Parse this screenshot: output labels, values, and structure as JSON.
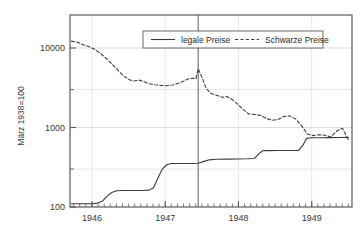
{
  "chart_data": {
    "type": "line",
    "title": "",
    "xlabel": "",
    "ylabel": "März 1938=100",
    "y_scale": "log",
    "ylim": [
      100,
      20000
    ],
    "xlim": [
      1945.7,
      1949.55
    ],
    "grid": true,
    "legend_position": "top-center",
    "y_ticks": [
      {
        "value": 100,
        "label": "100"
      },
      {
        "value": 1000,
        "label": "1000"
      },
      {
        "value": 10000,
        "label": "10000"
      }
    ],
    "y_minor_gridlines": [
      300,
      3000
    ],
    "x_ticks": [
      {
        "value": 1946,
        "label": "1946"
      },
      {
        "value": 1947,
        "label": "1947"
      },
      {
        "value": 1948,
        "label": "1948"
      },
      {
        "value": 1949,
        "label": "1949"
      }
    ],
    "annotations": [
      {
        "type": "vline",
        "x": 1947.45,
        "label": ""
      }
    ],
    "series": [
      {
        "name": "legale Preise",
        "style": "solid",
        "color": "#3c3c3c",
        "points": [
          [
            1945.72,
            110
          ],
          [
            1945.8,
            110
          ],
          [
            1945.9,
            110
          ],
          [
            1946.0,
            110
          ],
          [
            1946.08,
            112
          ],
          [
            1946.14,
            118
          ],
          [
            1946.2,
            135
          ],
          [
            1946.27,
            152
          ],
          [
            1946.34,
            160
          ],
          [
            1946.42,
            161
          ],
          [
            1946.5,
            161
          ],
          [
            1946.6,
            161
          ],
          [
            1946.7,
            161
          ],
          [
            1946.78,
            163
          ],
          [
            1946.84,
            175
          ],
          [
            1946.9,
            230
          ],
          [
            1946.96,
            300
          ],
          [
            1947.02,
            340
          ],
          [
            1947.08,
            352
          ],
          [
            1947.16,
            353
          ],
          [
            1947.28,
            353
          ],
          [
            1947.4,
            353
          ],
          [
            1947.45,
            355
          ],
          [
            1947.52,
            372
          ],
          [
            1947.6,
            392
          ],
          [
            1947.7,
            398
          ],
          [
            1947.85,
            400
          ],
          [
            1948.0,
            402
          ],
          [
            1948.12,
            404
          ],
          [
            1948.22,
            408
          ],
          [
            1948.28,
            470
          ],
          [
            1948.33,
            510
          ],
          [
            1948.4,
            512
          ],
          [
            1948.55,
            513
          ],
          [
            1948.7,
            514
          ],
          [
            1948.82,
            515
          ],
          [
            1948.88,
            600
          ],
          [
            1948.93,
            730
          ],
          [
            1949.0,
            742
          ],
          [
            1949.12,
            744
          ],
          [
            1949.25,
            745
          ],
          [
            1949.38,
            748
          ],
          [
            1949.5,
            752
          ]
        ]
      },
      {
        "name": "Schwarze Preise",
        "style": "dashed",
        "color": "#3c3c3c",
        "points": [
          [
            1945.72,
            12200
          ],
          [
            1945.8,
            11800
          ],
          [
            1945.88,
            11000
          ],
          [
            1945.96,
            10400
          ],
          [
            1946.04,
            9600
          ],
          [
            1946.12,
            8500
          ],
          [
            1946.2,
            7300
          ],
          [
            1946.28,
            6200
          ],
          [
            1946.36,
            5200
          ],
          [
            1946.44,
            4400
          ],
          [
            1946.52,
            3950
          ],
          [
            1946.58,
            3850
          ],
          [
            1946.64,
            3950
          ],
          [
            1946.7,
            3800
          ],
          [
            1946.78,
            3550
          ],
          [
            1946.86,
            3450
          ],
          [
            1946.94,
            3380
          ],
          [
            1947.02,
            3350
          ],
          [
            1947.1,
            3420
          ],
          [
            1947.18,
            3600
          ],
          [
            1947.26,
            3850
          ],
          [
            1947.32,
            4100
          ],
          [
            1947.38,
            4150
          ],
          [
            1947.42,
            4100
          ],
          [
            1947.45,
            5500
          ],
          [
            1947.5,
            4300
          ],
          [
            1947.56,
            3100
          ],
          [
            1947.62,
            2700
          ],
          [
            1947.7,
            2550
          ],
          [
            1947.78,
            2400
          ],
          [
            1947.84,
            2450
          ],
          [
            1947.9,
            2300
          ],
          [
            1947.98,
            2000
          ],
          [
            1948.06,
            1700
          ],
          [
            1948.14,
            1480
          ],
          [
            1948.22,
            1460
          ],
          [
            1948.3,
            1420
          ],
          [
            1948.38,
            1300
          ],
          [
            1948.46,
            1230
          ],
          [
            1948.54,
            1260
          ],
          [
            1948.62,
            1380
          ],
          [
            1948.7,
            1400
          ],
          [
            1948.78,
            1280
          ],
          [
            1948.86,
            1060
          ],
          [
            1948.94,
            830
          ],
          [
            1949.02,
            790
          ],
          [
            1949.1,
            810
          ],
          [
            1949.18,
            800
          ],
          [
            1949.26,
            760
          ],
          [
            1949.34,
            900
          ],
          [
            1949.42,
            980
          ],
          [
            1949.5,
            700
          ]
        ]
      }
    ]
  },
  "legend": {
    "items": [
      {
        "label": "legale Preise",
        "style": "solid"
      },
      {
        "label": "Schwarze Preise",
        "style": "dashed"
      }
    ]
  }
}
